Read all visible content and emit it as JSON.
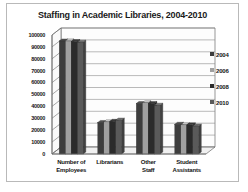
{
  "chart_data": {
    "type": "bar",
    "title": "Staffing in Academic Libraries, 2004-2010",
    "xlabel": "",
    "ylabel": "",
    "ylim": [
      0,
      100000
    ],
    "ytick_step": 10000,
    "yticks": [
      "100000",
      "90000",
      "80000",
      "70000",
      "60000",
      "50000",
      "40000",
      "30000",
      "20000",
      "10000",
      "0"
    ],
    "grid": true,
    "legend_position": "right",
    "style": "3d-clustered-column-grayscale",
    "categories": [
      "Number of Employees",
      "Librarians",
      "Other Staff",
      "Student Assistants"
    ],
    "category_lines": [
      [
        "Number of",
        "Employees"
      ],
      [
        "Librarians",
        ""
      ],
      [
        "Other",
        "Staff"
      ],
      [
        "Student",
        "Assistants"
      ]
    ],
    "series": [
      {
        "name": "2004",
        "color": "#3d3d3d",
        "values": [
          95000,
          26500,
          42500,
          25000
        ]
      },
      {
        "name": "2006",
        "color": "#a0a0a0",
        "values": [
          95000,
          27000,
          43000,
          24500
        ]
      },
      {
        "name": "2008",
        "color": "#2b2b2b",
        "values": [
          94500,
          27500,
          42500,
          24500
        ]
      },
      {
        "name": "2010",
        "color": "#5a5a5a",
        "values": [
          94000,
          28500,
          41000,
          23500
        ]
      }
    ]
  },
  "colors": {
    "frame_border": "#b9b9b9",
    "grid_line": "#8c8c8c",
    "axis_line": "#6b6b6b",
    "wall_fill": "#fdfdfd",
    "floor_fill": "#f0f0f0",
    "text": "#151515"
  }
}
